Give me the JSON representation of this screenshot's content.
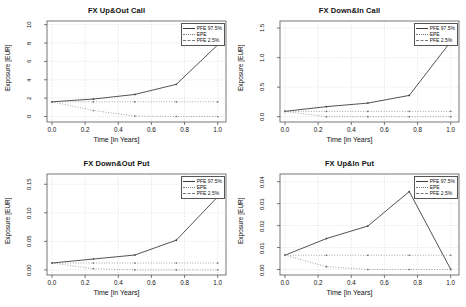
{
  "figure": {
    "background": "#ffffff",
    "line_color": "#3f3f3f",
    "grid_color": "#d9d9d9",
    "frame_color": "#555555",
    "panel_count": 4
  },
  "common": {
    "xlabel": "Time [in Years]",
    "ylabel": "Exposure [EUR]",
    "xticks": [
      "0.0",
      "0.2",
      "0.4",
      "0.6",
      "0.8",
      "1.0"
    ],
    "legend": [
      {
        "label": "PFE 97.5%",
        "style": "solid"
      },
      {
        "label": "EPE",
        "style": "dotted"
      },
      {
        "label": "PFE 2.5%",
        "style": "dashed"
      }
    ]
  },
  "chart_data": [
    {
      "type": "line",
      "title": "FX Up&Out Call",
      "xlabel": "Time [in Years]",
      "ylabel": "Exposure [EUR]",
      "x": [
        0.0,
        0.25,
        0.5,
        0.75,
        1.0
      ],
      "xlim": [
        -0.03,
        1.05
      ],
      "ylim": [
        -0.6,
        10.4
      ],
      "yticks": [
        "0",
        "2",
        "4",
        "6",
        "8",
        "10"
      ],
      "ytick_values": [
        0,
        2,
        4,
        6,
        8,
        10
      ],
      "grid": true,
      "legend_position": "top-right",
      "series": [
        {
          "name": "PFE 97.5%",
          "style": "solid",
          "values": [
            1.6,
            1.9,
            2.4,
            3.5,
            7.8
          ]
        },
        {
          "name": "EPE",
          "style": "dotted",
          "values": [
            1.6,
            1.6,
            1.6,
            1.6,
            1.6
          ]
        },
        {
          "name": "PFE 2.5%",
          "style": "dashed",
          "values": [
            1.6,
            0.65,
            0.05,
            0.0,
            0.0
          ]
        }
      ]
    },
    {
      "type": "line",
      "title": "FX Down&In Call",
      "xlabel": "Time [in Years]",
      "ylabel": "Exposure [EUR]",
      "x": [
        0.0,
        0.25,
        0.5,
        0.75,
        1.0
      ],
      "xlim": [
        -0.03,
        1.05
      ],
      "ylim": [
        -0.09,
        1.62
      ],
      "yticks": [
        "0.0",
        "0.5",
        "1.0",
        "1.5"
      ],
      "ytick_values": [
        0.0,
        0.5,
        1.0,
        1.5
      ],
      "grid": true,
      "legend_position": "top-right",
      "series": [
        {
          "name": "PFE 97.5%",
          "style": "solid",
          "values": [
            0.09,
            0.17,
            0.23,
            0.36,
            1.27
          ]
        },
        {
          "name": "EPE",
          "style": "dotted",
          "values": [
            0.09,
            0.09,
            0.09,
            0.09,
            0.09
          ]
        },
        {
          "name": "PFE 2.5%",
          "style": "dashed",
          "values": [
            0.09,
            0.0,
            0.0,
            0.0,
            0.0
          ]
        }
      ]
    },
    {
      "type": "line",
      "title": "FX Down&Out Put",
      "xlabel": "Time [in Years]",
      "ylabel": "Exposure [EUR]",
      "x": [
        0.0,
        0.25,
        0.5,
        0.75,
        1.0
      ],
      "xlim": [
        -0.03,
        1.05
      ],
      "ylim": [
        -0.009,
        0.168
      ],
      "yticks": [
        "0.00",
        "0.05",
        "0.10",
        "0.15"
      ],
      "ytick_values": [
        0.0,
        0.05,
        0.1,
        0.15
      ],
      "grid": true,
      "legend_position": "top-right",
      "series": [
        {
          "name": "PFE 97.5%",
          "style": "solid",
          "values": [
            0.012,
            0.019,
            0.026,
            0.052,
            0.128
          ]
        },
        {
          "name": "EPE",
          "style": "dotted",
          "values": [
            0.012,
            0.012,
            0.012,
            0.012,
            0.012
          ]
        },
        {
          "name": "PFE 2.5%",
          "style": "dashed",
          "values": [
            0.012,
            0.002,
            0.0,
            0.0,
            0.0
          ]
        }
      ]
    },
    {
      "type": "line",
      "title": "FX Up&In Put",
      "xlabel": "Time [in Years]",
      "ylabel": "Exposure [EUR]",
      "x": [
        0.0,
        0.25,
        0.5,
        0.75,
        1.0
      ],
      "xlim": [
        -0.03,
        1.05
      ],
      "ylim": [
        -0.0025,
        0.0435
      ],
      "yticks": [
        "0.00",
        "0.01",
        "0.02",
        "0.03",
        "0.04"
      ],
      "ytick_values": [
        0.0,
        0.01,
        0.02,
        0.03,
        0.04
      ],
      "grid": true,
      "legend_position": "top-right",
      "series": [
        {
          "name": "PFE 97.5%",
          "style": "solid",
          "values": [
            0.0065,
            0.0141,
            0.0198,
            0.0355,
            0.0001
          ]
        },
        {
          "name": "EPE",
          "style": "dotted",
          "values": [
            0.0065,
            0.0065,
            0.0065,
            0.0065,
            0.0065
          ]
        },
        {
          "name": "PFE 2.5%",
          "style": "dashed",
          "values": [
            0.0065,
            0.0013,
            0.0,
            0.0,
            0.0
          ]
        }
      ]
    }
  ]
}
